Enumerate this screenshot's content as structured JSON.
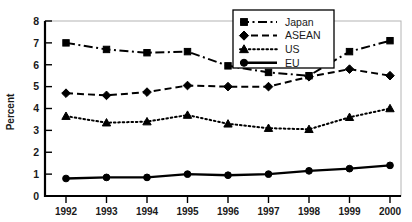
{
  "chart_data": {
    "type": "line",
    "title": "",
    "xlabel": "",
    "ylabel": "Percent",
    "categories": [
      "1992",
      "1993",
      "1994",
      "1995",
      "1996",
      "1997",
      "1998",
      "1999",
      "2000"
    ],
    "x": [
      1992,
      1993,
      1994,
      1995,
      1996,
      1997,
      1998,
      1999,
      2000
    ],
    "ylim": [
      0,
      8
    ],
    "yticks": [
      "0",
      "1",
      "2",
      "3",
      "4",
      "5",
      "6",
      "7",
      "8"
    ],
    "ytick_values": [
      0,
      1,
      2,
      3,
      4,
      5,
      6,
      7,
      8
    ],
    "grid": false,
    "legend_position": "top-center",
    "series": [
      {
        "name": "Japan",
        "marker": "square",
        "linestyle": "dash-dot",
        "color": "#000000",
        "values": [
          7.0,
          6.7,
          6.55,
          6.6,
          5.95,
          5.65,
          5.5,
          6.6,
          7.1
        ]
      },
      {
        "name": "ASEAN",
        "marker": "diamond",
        "linestyle": "dashed",
        "color": "#000000",
        "values": [
          4.7,
          4.6,
          4.75,
          5.05,
          5.0,
          5.0,
          5.45,
          5.8,
          5.5
        ]
      },
      {
        "name": "US",
        "marker": "triangle",
        "linestyle": "dotted",
        "color": "#000000",
        "values": [
          3.65,
          3.35,
          3.4,
          3.7,
          3.3,
          3.1,
          3.05,
          3.6,
          4.0
        ]
      },
      {
        "name": "EU",
        "marker": "circle",
        "linestyle": "solid",
        "color": "#000000",
        "values": [
          0.8,
          0.85,
          0.85,
          1.0,
          0.95,
          1.0,
          1.15,
          1.25,
          1.4
        ]
      }
    ]
  },
  "legend": {
    "items": [
      {
        "label": "Japan"
      },
      {
        "label": "ASEAN"
      },
      {
        "label": "US"
      },
      {
        "label": "EU"
      }
    ]
  }
}
